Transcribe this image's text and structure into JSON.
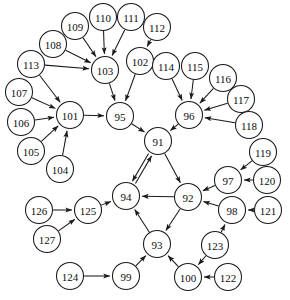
{
  "diagram": {
    "type": "directed-graph",
    "background_color": "#ffffff",
    "node_fill": "#ffffff",
    "node_stroke": "#1a1a1a",
    "edge_color": "#1a1a1a",
    "node_radius": 13.5,
    "width": 290,
    "height": 300
  },
  "nodes": [
    {
      "id": "91",
      "label": "91",
      "x": 158,
      "y": 141
    },
    {
      "id": "92",
      "label": "92",
      "x": 188,
      "y": 197
    },
    {
      "id": "93",
      "label": "93",
      "x": 157,
      "y": 244
    },
    {
      "id": "94",
      "label": "94",
      "x": 126,
      "y": 196
    },
    {
      "id": "95",
      "label": "95",
      "x": 120,
      "y": 116
    },
    {
      "id": "96",
      "label": "96",
      "x": 189,
      "y": 115
    },
    {
      "id": "97",
      "label": "97",
      "x": 228,
      "y": 180
    },
    {
      "id": "98",
      "label": "98",
      "x": 232,
      "y": 210
    },
    {
      "id": "99",
      "label": "99",
      "x": 126,
      "y": 276
    },
    {
      "id": "100",
      "label": "100",
      "x": 188,
      "y": 277
    },
    {
      "id": "101",
      "label": "101",
      "x": 70,
      "y": 115
    },
    {
      "id": "102",
      "label": "102",
      "x": 140,
      "y": 61
    },
    {
      "id": "103",
      "label": "103",
      "x": 105,
      "y": 70
    },
    {
      "id": "104",
      "label": "104",
      "x": 60,
      "y": 169
    },
    {
      "id": "105",
      "label": "105",
      "x": 31,
      "y": 151
    },
    {
      "id": "106",
      "label": "106",
      "x": 21,
      "y": 122
    },
    {
      "id": "107",
      "label": "107",
      "x": 19,
      "y": 92
    },
    {
      "id": "108",
      "label": "108",
      "x": 53,
      "y": 44
    },
    {
      "id": "109",
      "label": "109",
      "x": 75,
      "y": 26
    },
    {
      "id": "110",
      "label": "110",
      "x": 103,
      "y": 17
    },
    {
      "id": "111",
      "label": "111",
      "x": 131,
      "y": 17
    },
    {
      "id": "112",
      "label": "112",
      "x": 157,
      "y": 27
    },
    {
      "id": "113",
      "label": "113",
      "x": 31,
      "y": 64
    },
    {
      "id": "114",
      "label": "114",
      "x": 166,
      "y": 66
    },
    {
      "id": "115",
      "label": "115",
      "x": 195,
      "y": 66
    },
    {
      "id": "116",
      "label": "116",
      "x": 223,
      "y": 78
    },
    {
      "id": "117",
      "label": "117",
      "x": 241,
      "y": 99
    },
    {
      "id": "118",
      "label": "118",
      "x": 249,
      "y": 125
    },
    {
      "id": "119",
      "label": "119",
      "x": 263,
      "y": 152
    },
    {
      "id": "120",
      "label": "120",
      "x": 267,
      "y": 180
    },
    {
      "id": "121",
      "label": "121",
      "x": 268,
      "y": 210
    },
    {
      "id": "122",
      "label": "122",
      "x": 228,
      "y": 277
    },
    {
      "id": "123",
      "label": "123",
      "x": 215,
      "y": 245
    },
    {
      "id": "124",
      "label": "124",
      "x": 70,
      "y": 276
    },
    {
      "id": "125",
      "label": "125",
      "x": 88,
      "y": 210
    },
    {
      "id": "126",
      "label": "126",
      "x": 39,
      "y": 210
    },
    {
      "id": "127",
      "label": "127",
      "x": 47,
      "y": 239
    }
  ],
  "edges": [
    {
      "from": "95",
      "to": "91",
      "bidirectional": false
    },
    {
      "from": "96",
      "to": "91",
      "bidirectional": false
    },
    {
      "from": "91",
      "to": "92",
      "bidirectional": false
    },
    {
      "from": "91",
      "to": "94",
      "bidirectional": true
    },
    {
      "from": "92",
      "to": "94",
      "bidirectional": false
    },
    {
      "from": "92",
      "to": "93",
      "bidirectional": false
    },
    {
      "from": "93",
      "to": "94",
      "bidirectional": false
    },
    {
      "from": "97",
      "to": "92",
      "bidirectional": false
    },
    {
      "from": "98",
      "to": "92",
      "bidirectional": false
    },
    {
      "from": "99",
      "to": "93",
      "bidirectional": false
    },
    {
      "from": "100",
      "to": "93",
      "bidirectional": false
    },
    {
      "from": "101",
      "to": "95",
      "bidirectional": false
    },
    {
      "from": "102",
      "to": "95",
      "bidirectional": false
    },
    {
      "from": "103",
      "to": "95",
      "bidirectional": false
    },
    {
      "from": "104",
      "to": "101",
      "bidirectional": false
    },
    {
      "from": "105",
      "to": "101",
      "bidirectional": false
    },
    {
      "from": "106",
      "to": "101",
      "bidirectional": false
    },
    {
      "from": "107",
      "to": "101",
      "bidirectional": false
    },
    {
      "from": "113",
      "to": "101",
      "bidirectional": false
    },
    {
      "from": "113",
      "to": "103",
      "bidirectional": false
    },
    {
      "from": "108",
      "to": "103",
      "bidirectional": false
    },
    {
      "from": "109",
      "to": "103",
      "bidirectional": false
    },
    {
      "from": "110",
      "to": "103",
      "bidirectional": false
    },
    {
      "from": "111",
      "to": "103",
      "bidirectional": false
    },
    {
      "from": "112",
      "to": "102",
      "bidirectional": false
    },
    {
      "from": "114",
      "to": "96",
      "bidirectional": false
    },
    {
      "from": "115",
      "to": "96",
      "bidirectional": false
    },
    {
      "from": "116",
      "to": "96",
      "bidirectional": false
    },
    {
      "from": "117",
      "to": "96",
      "bidirectional": false
    },
    {
      "from": "118",
      "to": "96",
      "bidirectional": false
    },
    {
      "from": "119",
      "to": "97",
      "bidirectional": false
    },
    {
      "from": "120",
      "to": "97",
      "bidirectional": false
    },
    {
      "from": "121",
      "to": "98",
      "bidirectional": false
    },
    {
      "from": "123",
      "to": "98",
      "bidirectional": false
    },
    {
      "from": "123",
      "to": "100",
      "bidirectional": false
    },
    {
      "from": "122",
      "to": "100",
      "bidirectional": false
    },
    {
      "from": "124",
      "to": "99",
      "bidirectional": false
    },
    {
      "from": "125",
      "to": "94",
      "bidirectional": false
    },
    {
      "from": "126",
      "to": "125",
      "bidirectional": false
    },
    {
      "from": "127",
      "to": "125",
      "bidirectional": false
    }
  ]
}
